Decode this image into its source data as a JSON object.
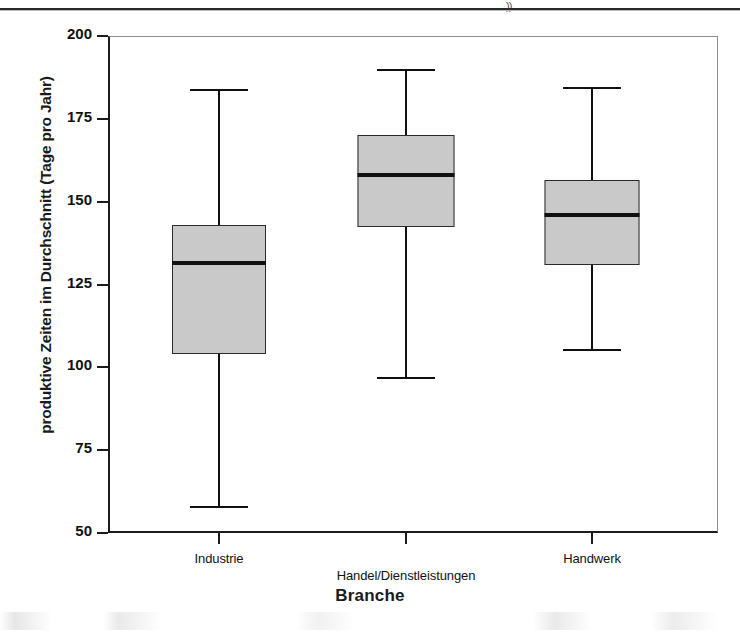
{
  "page": {
    "scan_mark": "))"
  },
  "chart_data": {
    "type": "box",
    "title": "",
    "xlabel": "Branche",
    "ylabel": "produktive Zeiten im Durchschnitt (Tage pro Jahr)",
    "ylim": [
      50,
      200
    ],
    "yticks": [
      200,
      175,
      150,
      125,
      100,
      75,
      50
    ],
    "ytick_labels": [
      "200",
      "175",
      "150",
      "125",
      "100",
      "75",
      "50"
    ],
    "grid": false,
    "legend": "none",
    "categories": [
      "Industrie",
      "Handel/Dienstleistungen",
      "Handwerk"
    ],
    "boxes": [
      {
        "category": "Industrie",
        "whisker_high": 184,
        "q3": 143,
        "median": 131.5,
        "q1": 104,
        "whisker_low": 58
      },
      {
        "category": "Handel/Dienstleistungen",
        "whisker_high": 190,
        "q3": 170,
        "median": 158,
        "q1": 142.5,
        "whisker_low": 97
      },
      {
        "category": "Handwerk",
        "whisker_high": 184.5,
        "q3": 156.5,
        "median": 146,
        "q1": 131,
        "whisker_low": 105.5
      }
    ],
    "colors": {
      "box_fill": "#c9c9c9",
      "box_edge": "#2a2a2a",
      "median": "#111111",
      "whisker": "#111111",
      "axis": "#1c1c1c"
    }
  }
}
